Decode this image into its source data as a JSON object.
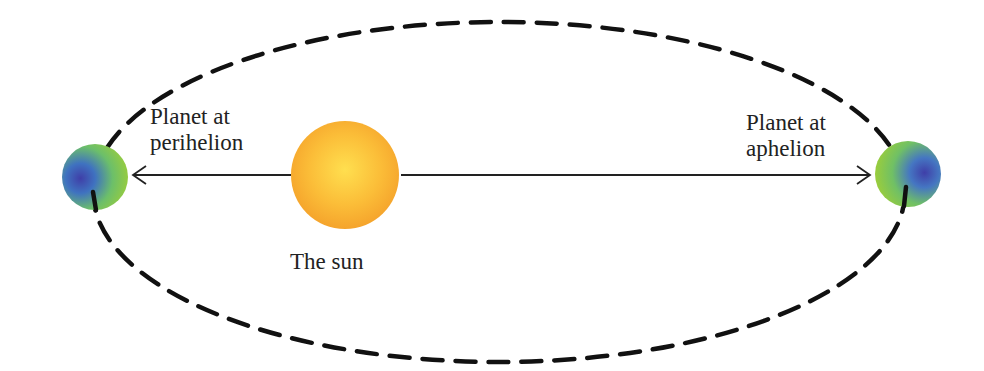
{
  "diagram": {
    "labels": {
      "perihelion_line1": "Planet at",
      "perihelion_line2": "perihelion",
      "aphelion_line1": "Planet at",
      "aphelion_line2": "aphelion",
      "sun": "The sun"
    },
    "colors": {
      "orbit": "#111111",
      "sun_center": "#ffd84a",
      "sun_edge": "#f6a52a",
      "planet_blue": "#3a4fb0",
      "planet_green": "#8cc63f",
      "arrow": "#222222"
    }
  }
}
